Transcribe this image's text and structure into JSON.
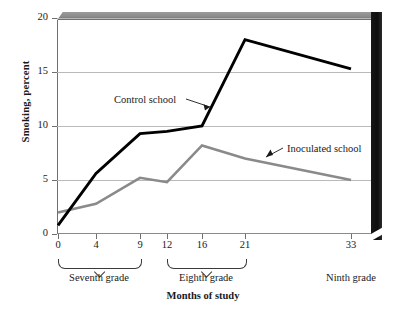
{
  "chart_data": {
    "type": "line",
    "title": "",
    "xlabel": "Months of study",
    "ylabel": "Smoking, percent",
    "xlim": [
      0,
      36
    ],
    "ylim": [
      0,
      20
    ],
    "yticks": [
      0,
      5,
      10,
      15,
      20
    ],
    "xticks": [
      0,
      4,
      9,
      12,
      16,
      21,
      33
    ],
    "grid": true,
    "legend": "inline-annotations",
    "x": [
      0,
      4,
      9,
      12,
      16,
      21,
      33
    ],
    "series": [
      {
        "name": "Control school",
        "color": "#000000",
        "values": [
          0.8,
          5.6,
          9.3,
          9.5,
          10.0,
          18.0,
          15.3
        ]
      },
      {
        "name": "Inoculated school",
        "color": "#8a8a8a",
        "values": [
          2.0,
          2.8,
          5.2,
          4.8,
          8.2,
          7.0,
          5.0
        ]
      }
    ],
    "annotations": [
      {
        "text": "Control school",
        "target_series": "Control school"
      },
      {
        "text": "Inoculated school",
        "target_series": "Inoculated school"
      }
    ],
    "xaxis_groups": [
      {
        "label": "Seventh grade",
        "from": 0,
        "to": 9,
        "bracket": true
      },
      {
        "label": "Eighth grade",
        "from": 12,
        "to": 21,
        "bracket": true
      },
      {
        "label": "Ninth grade",
        "from": 33,
        "to": 33,
        "bracket": false
      }
    ]
  },
  "ytick_labels": [
    "0",
    "5",
    "10",
    "15",
    "20"
  ],
  "xtick_labels": [
    "0",
    "4",
    "9",
    "12",
    "16",
    "21",
    "33"
  ],
  "axis": {
    "y_title": "Smoking, percent",
    "x_title": "Months of study"
  },
  "labels": {
    "control": "Control school",
    "inoculated": "Inoculated school",
    "seventh": "Seventh grade",
    "eighth": "Eighth grade",
    "ninth": "Ninth grade"
  },
  "colors": {
    "control_line": "#000000",
    "inoculated_line": "#8a8a8a",
    "grid": "#b9b9b9",
    "frame_top": "#8c8c8c",
    "frame_right": "#121212"
  }
}
